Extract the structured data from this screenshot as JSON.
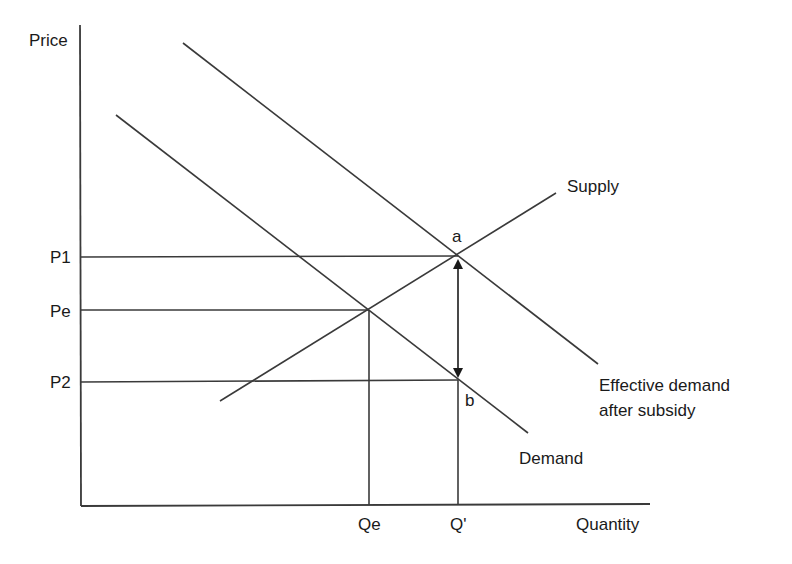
{
  "diagram": {
    "axes": {
      "y_label": "Price",
      "x_label": "Quantity"
    },
    "price_levels": [
      {
        "label": "P1",
        "key": "p1"
      },
      {
        "label": "Pe",
        "key": "pe"
      },
      {
        "label": "P2",
        "key": "p2"
      }
    ],
    "quantity_levels": [
      {
        "label": "Qe",
        "key": "qe"
      },
      {
        "label": "Q'",
        "key": "qprime"
      }
    ],
    "curves": {
      "supply": "Supply",
      "demand": "Demand",
      "effective_demand_line1": "Effective demand",
      "effective_demand_line2": "after subsidy"
    },
    "points": {
      "a": "a",
      "b": "b"
    },
    "colors": {
      "line": "#3a3a3a",
      "text": "#1a1a1a",
      "background": "#ffffff"
    }
  }
}
